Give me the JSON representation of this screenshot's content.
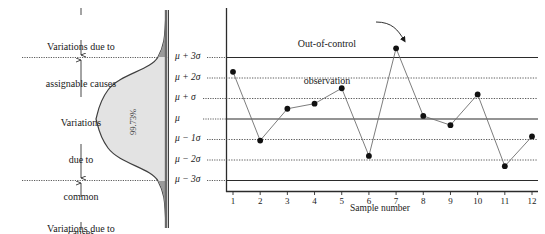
{
  "figure": {
    "title_top_note": "Variations due to assignable causes",
    "note_top_line1": "Variations due to",
    "note_top_line2": "assignable causes",
    "note_bottom_line1": "Variations due to",
    "note_bottom_line2": "assignable causes",
    "note_middle_line1": "Variations",
    "note_middle_line2": "due to",
    "note_middle_line3": "common",
    "note_middle_line4": "causes",
    "distribution_area_label": "99.73%",
    "annotation_line1": "Out-of-control",
    "annotation_line2": "observation",
    "colors": {
      "curve_fill": "#e3e3e3",
      "curve_stroke": "#3f3f3f",
      "axis": "#2b2b2b",
      "gridline_dotted": "#4a4a4a",
      "point": "#111111",
      "series_line": "#6e6e6e"
    }
  },
  "sigma_axis": {
    "labels": [
      "μ + 3σ",
      "μ + 2σ",
      "μ + σ",
      "μ",
      "μ − 1σ",
      "μ − 2σ",
      "μ − 3σ"
    ],
    "values": [
      3,
      2,
      1,
      0,
      -1,
      -2,
      -3
    ],
    "solid_lines": [
      3,
      0,
      -3
    ],
    "dotted_lines": [
      2,
      1,
      -1,
      -2
    ]
  },
  "chart_data": {
    "type": "line",
    "title": "",
    "subtitle": "",
    "xlabel": "Sample number",
    "ylabel": "",
    "categories": [
      "1",
      "2",
      "3",
      "4",
      "5",
      "6",
      "7",
      "8",
      "9",
      "10",
      "11",
      "12"
    ],
    "x": [
      1,
      2,
      3,
      4,
      5,
      6,
      7,
      8,
      9,
      10,
      11,
      12
    ],
    "values": [
      2.3,
      -1.05,
      0.5,
      0.75,
      1.5,
      -1.8,
      3.45,
      0.15,
      -0.3,
      1.2,
      -2.3,
      -0.85
    ],
    "series": [
      {
        "name": "Sample observation",
        "values": [
          2.3,
          -1.05,
          0.5,
          0.75,
          1.5,
          -1.8,
          3.45,
          0.15,
          -0.3,
          1.2,
          -2.3,
          -0.85
        ]
      }
    ],
    "ylim": [
      -3.6,
      3.9
    ],
    "xlim": [
      0.4,
      12.6
    ],
    "yunits": "sigma",
    "grid": true,
    "legend": "none",
    "annotations": [
      {
        "text": "Out-of-control observation",
        "target_x": 7,
        "target_y": 3.45
      }
    ],
    "control_limits": {
      "upper": 3,
      "center": 0,
      "lower": -3
    },
    "out_of_control_points": [
      7
    ]
  }
}
